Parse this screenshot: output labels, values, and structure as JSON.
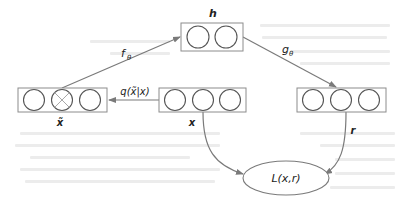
{
  "diagram": {
    "colors": {
      "line": "#7a7a7a",
      "box_border": "#8c8c8c",
      "circle": "#555555",
      "cross": "#a8a8a8",
      "text": "#222222",
      "background": "#ffffff"
    },
    "nodes": [
      {
        "id": "x_tilde",
        "label": "x̃",
        "units": 3,
        "corrupted_unit_index": 1
      },
      {
        "id": "x",
        "label": "x",
        "units": 3
      },
      {
        "id": "h",
        "label": "h",
        "units": 2
      },
      {
        "id": "r",
        "label": "r",
        "units": 3
      },
      {
        "id": "loss",
        "label": "L(x,r)",
        "shape": "ellipse"
      }
    ],
    "edges": [
      {
        "from": "x",
        "to": "x_tilde",
        "label": "q(x̃|x)"
      },
      {
        "from": "x_tilde",
        "to": "h",
        "label": "fθ"
      },
      {
        "from": "h",
        "to": "r",
        "label": "gθ"
      },
      {
        "from": "x",
        "to": "loss",
        "label": ""
      },
      {
        "from": "r",
        "to": "loss",
        "label": ""
      }
    ]
  },
  "labels": {
    "h": "h",
    "x": "x",
    "x_tilde": "x̃",
    "r": "r",
    "loss": "L(x,r)",
    "q": "q(x̃|x)",
    "f": "f",
    "f_sub": "θ",
    "g": "g",
    "g_sub": "θ"
  }
}
